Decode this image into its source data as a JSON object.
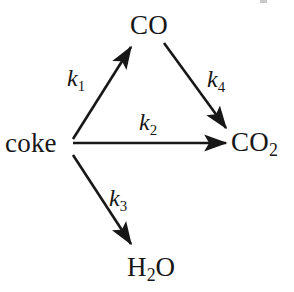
{
  "figure": {
    "kind": "reaction-scheme",
    "background_color": "#ffffff",
    "ink_color": "#171717",
    "width": 294,
    "height": 292
  },
  "nodes": [
    {
      "id": "coke",
      "label": "coke",
      "html": "coke",
      "x": 5,
      "y": 130
    },
    {
      "id": "co",
      "label": "CO",
      "html": "CO",
      "x": 130,
      "y": 12
    },
    {
      "id": "co2",
      "label": "CO2",
      "html": "CO<sub>2</sub>",
      "x": 231,
      "y": 129
    },
    {
      "id": "h2o",
      "label": "H2O",
      "html": "H<sub>2</sub>O",
      "x": 127,
      "y": 254
    }
  ],
  "arrows": [
    {
      "id": "k1",
      "from": "coke",
      "to": "co",
      "rate_label": "k1",
      "rate_html": "k<sub>1</sub>",
      "x1": 73,
      "y1": 139,
      "x2": 133,
      "y2": 44,
      "label_x": 67,
      "label_y": 66
    },
    {
      "id": "k2",
      "from": "coke",
      "to": "co2",
      "rate_label": "k2",
      "rate_html": "k<sub>2</sub>",
      "x1": 73,
      "y1": 143,
      "x2": 229,
      "y2": 143,
      "label_x": 139,
      "label_y": 110
    },
    {
      "id": "k3",
      "from": "coke",
      "to": "h2o",
      "rate_label": "k3",
      "rate_html": "k<sub>3</sub>",
      "x1": 73,
      "y1": 155,
      "x2": 133,
      "y2": 247,
      "label_x": 109,
      "label_y": 186
    },
    {
      "id": "k4",
      "from": "co",
      "to": "co2",
      "rate_label": "k4",
      "rate_html": "k<sub>4</sub>",
      "x1": 164,
      "y1": 43,
      "x2": 228,
      "y2": 131,
      "label_x": 207,
      "label_y": 67
    }
  ],
  "rate_constants": {
    "k1": "k1",
    "k2": "k2",
    "k3": "k3",
    "k4": "k4"
  },
  "reactions": [
    {
      "step": "k1",
      "equation": "coke -> CO"
    },
    {
      "step": "k2",
      "equation": "coke -> CO2"
    },
    {
      "step": "k3",
      "equation": "coke -> H2O"
    },
    {
      "step": "k4",
      "equation": "CO -> CO2"
    }
  ]
}
